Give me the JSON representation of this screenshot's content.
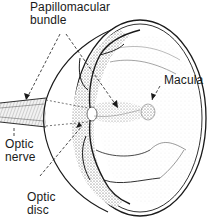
{
  "diagram": {
    "labels": {
      "papillomacular_line1": "Papillomacular",
      "papillomacular_line2": "bundle",
      "macula": "Macula",
      "optic_nerve_line1": "Optic",
      "optic_nerve_line2": "nerve",
      "optic_disc_line1": "Optic",
      "optic_disc_line2": "disc"
    },
    "colors": {
      "ink": "#1a1a1a",
      "stipple": "#9a9a9a",
      "background": "#ffffff"
    }
  }
}
